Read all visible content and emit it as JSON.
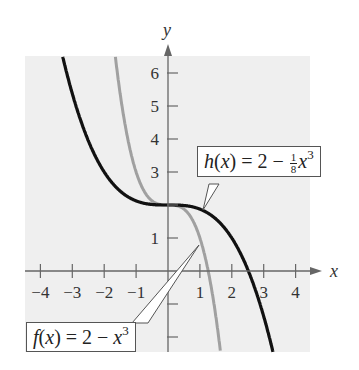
{
  "chart_data": {
    "type": "line",
    "title": "",
    "xlabel": "x",
    "ylabel": "y",
    "xlim": [
      -4.5,
      4.5
    ],
    "ylim": [
      -2.5,
      6.5
    ],
    "x_ticks": [
      -4,
      -3,
      -2,
      -1,
      1,
      2,
      3,
      4
    ],
    "y_ticks": [
      1,
      3,
      4,
      5,
      6
    ],
    "y_ticks_unlabeled": [
      -1,
      -2,
      2
    ],
    "grid": false,
    "series": [
      {
        "name": "h(x) = 2 - (1/8)x^3",
        "expression": "2 - x^3/8",
        "color": "#111111",
        "x": [
          -3.3,
          -3,
          -2,
          -1,
          0,
          1,
          2,
          2.52,
          3,
          3.4
        ],
        "values": [
          6.49,
          5.375,
          3.0,
          2.125,
          2.0,
          1.875,
          1.0,
          0.0,
          -1.375,
          -2.91
        ]
      },
      {
        "name": "f(x) = 2 - x^3",
        "expression": "2 - x^3",
        "color": "#a0a0a0",
        "x": [
          -1.65,
          -1.5,
          -1,
          -0.5,
          0,
          0.5,
          1,
          1.26,
          1.5,
          1.7
        ],
        "values": [
          6.49,
          5.375,
          3.0,
          2.125,
          2.0,
          1.875,
          1.0,
          0.0,
          -1.375,
          -2.91
        ]
      }
    ],
    "annotations": [
      {
        "label": "h(x) = 2 − (1/8)x³",
        "points_to": [
          1.2,
          1.8
        ]
      },
      {
        "label": "f(x) = 2 − x³",
        "points_to": [
          1.0,
          1.0
        ]
      }
    ]
  },
  "axes": {
    "x_label": "x",
    "y_label": "y"
  },
  "ticks": {
    "x": [
      "−4",
      "−3",
      "−2",
      "−1",
      "1",
      "2",
      "3",
      "4"
    ],
    "y": [
      "1",
      "3",
      "4",
      "5",
      "6"
    ]
  },
  "callouts": {
    "h": {
      "name": "h",
      "var": "x",
      "lhs_rest": ") = 2 − ",
      "num": "1",
      "den": "8",
      "x": "x",
      "exp": "3"
    },
    "f": {
      "name": "f",
      "var": "x",
      "lhs_rest": ") = 2 − ",
      "x": "x",
      "exp": "3"
    }
  },
  "colors": {
    "background": "#f0f0f0",
    "axis": "#666666",
    "h_curve": "#111111",
    "f_curve": "#a0a0a0"
  }
}
